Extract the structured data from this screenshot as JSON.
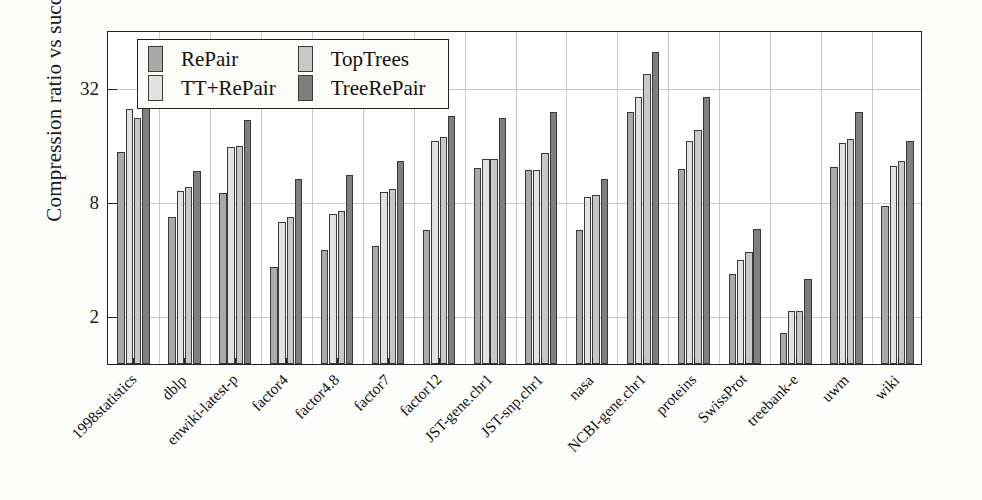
{
  "chart_data": {
    "type": "bar",
    "title": "",
    "xlabel": "",
    "ylabel": "Compression ratio vs succinct",
    "yscale": "log2",
    "ylim": [
      1.1,
      64
    ],
    "yticks": [
      2,
      8,
      32
    ],
    "ytick_labels": [
      "2",
      "8",
      "32"
    ],
    "grid": true,
    "legend_position": "top-left-inside",
    "categories": [
      "1998statistics",
      "dblp",
      "enwiki-latest-p",
      "factor4",
      "factor4.8",
      "factor7",
      "factor12",
      "JST-gene.chr1",
      "JST-snp.chr1",
      "nasa",
      "NCBI-gene.chr1",
      "proteins",
      "SwissProt",
      "treebank-e",
      "uwm",
      "wiki"
    ],
    "series": [
      {
        "name": "RePair",
        "color": "#a9a9a9",
        "values": [
          14.5,
          6.6,
          8.8,
          3.6,
          4.4,
          4.6,
          5.6,
          12.0,
          11.6,
          5.6,
          23.5,
          11.8,
          3.3,
          1.6,
          12.1,
          7.5
        ]
      },
      {
        "name": "TT+RePair",
        "color": "#e2e2e2",
        "values": [
          24.5,
          9.0,
          15.4,
          6.2,
          6.8,
          8.9,
          16.5,
          13.3,
          11.7,
          8.4,
          28.5,
          16.5,
          3.9,
          2.1,
          16.2,
          12.3
        ]
      },
      {
        "name": "TopTrees",
        "color": "#c8c8c8",
        "values": [
          22.0,
          9.5,
          15.6,
          6.6,
          7.1,
          9.2,
          17.4,
          13.3,
          14.4,
          8.6,
          37.5,
          19.0,
          4.3,
          2.1,
          17.0,
          13.0
        ]
      },
      {
        "name": "TreeRePair",
        "color": "#7f7f7f",
        "values": [
          28.5,
          11.5,
          21.5,
          10.5,
          11.0,
          13.0,
          22.5,
          22.0,
          23.5,
          10.5,
          49.0,
          28.5,
          5.7,
          3.1,
          23.5,
          16.5
        ]
      }
    ]
  },
  "legend": {
    "items": [
      {
        "label": "RePair",
        "color": "#a9a9a9"
      },
      {
        "label": "TopTrees",
        "color": "#c8c8c8"
      },
      {
        "label": "TT+RePair",
        "color": "#e2e2e2"
      },
      {
        "label": "TreeRePair",
        "color": "#7f7f7f"
      }
    ]
  }
}
